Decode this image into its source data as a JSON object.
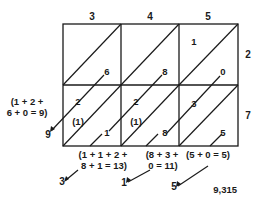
{
  "diagram": {
    "type": "lattice-multiplication",
    "multiplicand_digits": [
      "3",
      "4",
      "5"
    ],
    "multiplier_digits": [
      "2",
      "7"
    ],
    "cells": [
      [
        {
          "tens": "",
          "ones": "6"
        },
        {
          "tens": "",
          "ones": "8"
        },
        {
          "tens": "1",
          "ones": "0"
        }
      ],
      [
        {
          "tens": "2",
          "ones": "1"
        },
        {
          "tens": "2",
          "ones": "8"
        },
        {
          "tens": "3",
          "ones": "5"
        }
      ]
    ],
    "carry_marks": [
      "(1)",
      "(1)"
    ],
    "diagonal_sums": [
      {
        "label_line1": "(1 + 2 +",
        "label_line2": "6 + 0 = 9)",
        "result_digit": "9"
      },
      {
        "label_line1": "(1 + 1 + 2 +",
        "label_line2": "8 + 1 = 13)",
        "result_digit": "3"
      },
      {
        "label_line1": "(8 + 3 +",
        "label_line2": "0 = 11)",
        "result_digit": "1"
      },
      {
        "label_line1": "(5 + 0 = 5)",
        "label_line2": "",
        "result_digit": "5"
      }
    ],
    "product": "9,315"
  }
}
